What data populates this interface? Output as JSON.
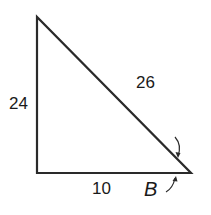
{
  "diagram": {
    "type": "right-triangle",
    "vertices": {
      "top": [
        37,
        17
      ],
      "right_angle": [
        37,
        173
      ],
      "B": [
        191,
        173
      ]
    },
    "sides": {
      "vertical": "24",
      "hypotenuse": "26",
      "horizontal": "10"
    },
    "angle_label": "B",
    "stroke_color": "#2a2a2a"
  }
}
